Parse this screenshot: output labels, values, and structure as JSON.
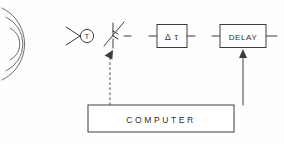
{
  "diagram": {
    "canvas": {
      "width": 284,
      "height": 144,
      "background": "#ffffff"
    },
    "stroke_color": "#3c3c3c",
    "wave": {
      "name": "acoustic-wavefronts",
      "arc_count": 3,
      "description": "Three concentric radiating arcs at left edge"
    },
    "transducer": {
      "label": "T",
      "symbol": "triangle-into-circle",
      "description": "Transducer symbol: arrow feeding a circled T"
    },
    "variable_element": {
      "label": "",
      "symbol": "variable-attenuator",
      "description": "Vertical lead with diagonal adjustable arrow"
    },
    "blocks": [
      {
        "id": "dtau",
        "label": "Δ τ",
        "name": "delta-tau-block"
      },
      {
        "id": "delay",
        "label": "DELAY",
        "name": "delay-block"
      },
      {
        "id": "computer",
        "label": "COMPUTER",
        "name": "computer-block"
      }
    ],
    "connections": [
      {
        "from": "computer",
        "to": "variable_element",
        "style": "dashed",
        "arrow": "up-left"
      },
      {
        "from": "computer",
        "to": "delay",
        "style": "solid",
        "arrow": "up"
      }
    ]
  }
}
